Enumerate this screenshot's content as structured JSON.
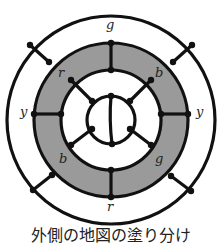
{
  "diagram": {
    "ring_fill": "#9a9a9a",
    "labels": {
      "top": "g",
      "upper_left": "r",
      "upper_right": "b",
      "left": "y",
      "right": "y",
      "lower_left": "b",
      "lower_right": "g",
      "bottom": "r"
    }
  },
  "caption": "外側の地図の塗り分け"
}
